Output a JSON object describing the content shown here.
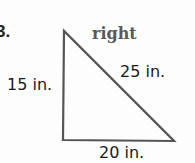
{
  "problem": {
    "number": "3.",
    "classification": "right",
    "sides": {
      "left": "15 in.",
      "hypotenuse": "25 in.",
      "bottom": "20 in."
    }
  },
  "colors": {
    "stroke": "#555555",
    "text": "#1a1a1a",
    "classification": "#5a5a5a"
  }
}
